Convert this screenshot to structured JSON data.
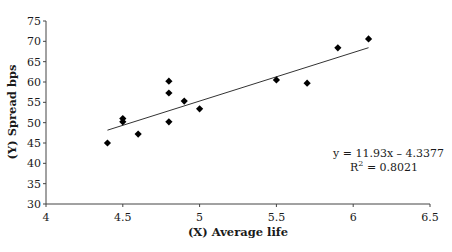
{
  "chart_data": {
    "type": "scatter",
    "title": "",
    "xlabel": "(X) Average life",
    "ylabel": "(Y) Spread bps",
    "xlim": [
      4,
      6.5
    ],
    "ylim": [
      30,
      75
    ],
    "xticks": [
      4,
      4.5,
      5,
      5.5,
      6,
      6.5
    ],
    "xtick_labels": [
      "4",
      "4.5",
      "5",
      "5.5",
      "6",
      "6.5"
    ],
    "yticks": [
      30,
      35,
      40,
      45,
      50,
      55,
      60,
      65,
      70,
      75
    ],
    "ytick_labels": [
      "30",
      "35",
      "40",
      "45",
      "50",
      "55",
      "60",
      "65",
      "70",
      "75"
    ],
    "grid": false,
    "legend": null,
    "marker": "diamond",
    "series": [
      {
        "name": "Spread vs Average life",
        "x": [
          4.4,
          4.5,
          4.5,
          4.6,
          4.8,
          4.8,
          4.8,
          4.9,
          5.0,
          5.5,
          5.7,
          5.9,
          6.1
        ],
        "y": [
          45.0,
          51.0,
          50.2,
          47.2,
          60.2,
          57.3,
          50.2,
          55.3,
          53.4,
          60.5,
          59.7,
          68.4,
          70.6
        ]
      }
    ],
    "trendline": {
      "type": "linear",
      "slope": 11.93,
      "intercept": -4.3377,
      "x_range": [
        4.4,
        6.1
      ],
      "equation": "y = 11.93x – 4.3377",
      "r_squared_label": "R",
      "r_squared_sup": "2",
      "r_squared_value": " = 0.8021"
    }
  }
}
